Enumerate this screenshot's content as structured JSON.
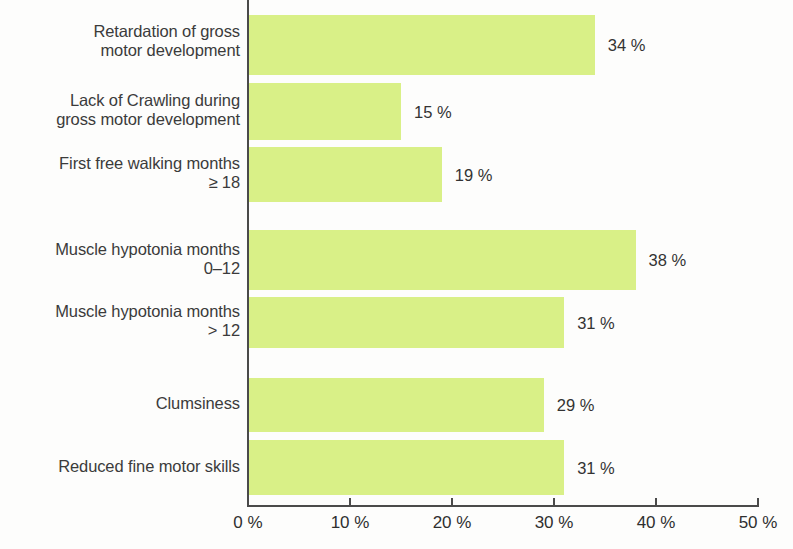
{
  "chart_data": {
    "type": "bar",
    "orientation": "horizontal",
    "title": "",
    "subtitle": "",
    "xlabel": "",
    "ylabel": "",
    "xlim": [
      0,
      50
    ],
    "xticks": [
      0,
      10,
      20,
      30,
      40,
      50
    ],
    "xtick_labels": [
      "0 %",
      "10 %",
      "20 %",
      "30 %",
      "40 %",
      "50 %"
    ],
    "grid": false,
    "legend": null,
    "value_label_suffix": " %",
    "bar_color": "#d9f087",
    "axis_color": "#4a4a4a",
    "text_color": "#3b3b3b",
    "categories": [
      "Retardation of gross\nmotor development",
      "Lack of Crawling during\ngross motor development",
      "First free walking months\n≥ 18",
      "Muscle hypotonia months\n0–12",
      "Muscle hypotonia months\n> 12",
      "Clumsiness",
      "Reduced fine motor skills"
    ],
    "values": [
      34,
      15,
      19,
      38,
      31,
      29,
      31
    ],
    "value_labels": [
      "34 %",
      "15 %",
      "19 %",
      "38 %",
      "31 %",
      "29 %",
      "31 %"
    ]
  },
  "bars": [
    {
      "label": "Retardation of gross\nmotor development",
      "value": 34,
      "value_label": "34 %",
      "top": 15,
      "height": 60,
      "label_top": 22
    },
    {
      "label": "Lack of Crawling during\ngross motor development",
      "value": 15,
      "value_label": "15 %",
      "top": 83,
      "height": 57,
      "label_top": 91
    },
    {
      "label": "First free walking months\n≥ 18",
      "value": 19,
      "value_label": "19 %",
      "top": 147,
      "height": 55,
      "label_top": 154
    },
    {
      "label": "Muscle hypotonia months\n0–12",
      "value": 38,
      "value_label": "38 %",
      "top": 230,
      "height": 60,
      "label_top": 240
    },
    {
      "label": "Muscle hypotonia months\n> 12",
      "value": 31,
      "value_label": "31 %",
      "top": 297,
      "height": 51,
      "label_top": 302
    },
    {
      "label": "Clumsiness",
      "value": 29,
      "value_label": "29 %",
      "top": 378,
      "height": 54,
      "label_top": 394
    },
    {
      "label": "Reduced fine motor skills",
      "value": 31,
      "value_label": "31 %",
      "top": 440,
      "height": 55,
      "label_top": 457
    }
  ],
  "axis": {
    "ticks": [
      {
        "value": 0,
        "label": "0 %"
      },
      {
        "value": 10,
        "label": "10 %"
      },
      {
        "value": 20,
        "label": "20 %"
      },
      {
        "value": 30,
        "label": "30 %"
      },
      {
        "value": 40,
        "label": "40 %"
      },
      {
        "value": 50,
        "label": "50 %"
      }
    ],
    "max": 50,
    "pixels_per_unit": 10.2
  }
}
